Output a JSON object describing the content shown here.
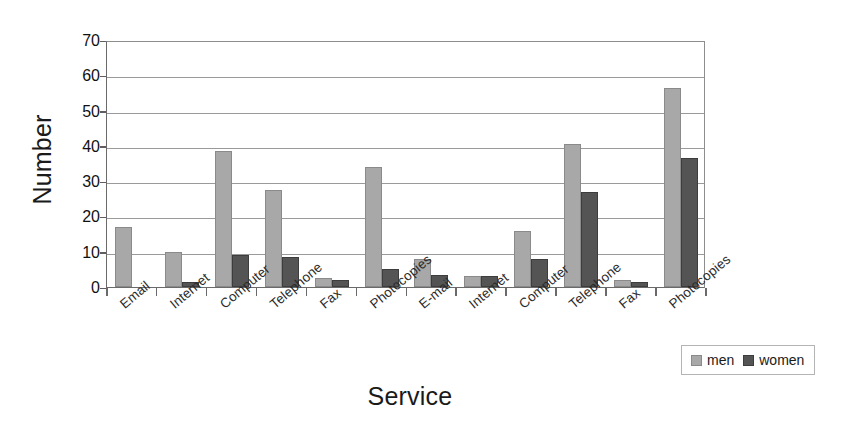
{
  "chart_data": {
    "type": "bar",
    "title": "",
    "xlabel": "Service",
    "ylabel": "Number",
    "ylim": [
      0,
      70
    ],
    "ytick_step": 10,
    "yticks": [
      70,
      60,
      50,
      40,
      30,
      20,
      10,
      0
    ],
    "grid": true,
    "legend_position": "bottom-right",
    "categories": [
      "Email",
      "Internet",
      "Computer",
      "Telephone",
      "Fax",
      "Photocopies",
      "E-mail",
      "Internet",
      "Computer",
      "Telephone",
      "Fax",
      "Photocopies"
    ],
    "series": [
      {
        "name": "men",
        "color": "#a8a8a8",
        "values": [
          17,
          10,
          38.5,
          27.5,
          2.5,
          34,
          8,
          3,
          16,
          40.5,
          2,
          56.5
        ]
      },
      {
        "name": "women",
        "color": "#545454",
        "values": [
          0,
          1.5,
          9,
          8.5,
          2,
          5,
          3.5,
          3,
          8,
          27,
          1.5,
          36.5
        ]
      }
    ]
  },
  "legend": {
    "items": [
      {
        "label": "men",
        "key": "men"
      },
      {
        "label": "women",
        "key": "women"
      }
    ]
  }
}
